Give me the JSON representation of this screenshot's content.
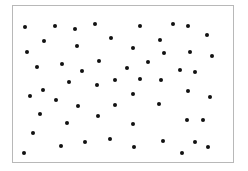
{
  "frame": {
    "left": 12,
    "top": 5,
    "width": 222,
    "height": 158,
    "border_color": "#b8b8b8"
  },
  "dot_color": "#111111",
  "dots": [
    [
      25,
      27
    ],
    [
      55,
      26
    ],
    [
      75,
      29
    ],
    [
      95,
      24
    ],
    [
      111,
      38
    ],
    [
      44,
      41
    ],
    [
      77,
      46
    ],
    [
      27,
      52
    ],
    [
      37,
      67
    ],
    [
      62,
      64
    ],
    [
      99,
      61
    ],
    [
      82,
      71
    ],
    [
      69,
      82
    ],
    [
      97,
      85
    ],
    [
      115,
      80
    ],
    [
      140,
      26
    ],
    [
      173,
      24
    ],
    [
      188,
      26
    ],
    [
      207,
      35
    ],
    [
      160,
      40
    ],
    [
      133,
      48
    ],
    [
      164,
      53
    ],
    [
      190,
      52
    ],
    [
      212,
      56
    ],
    [
      148,
      62
    ],
    [
      127,
      68
    ],
    [
      180,
      70
    ],
    [
      195,
      72
    ],
    [
      140,
      79
    ],
    [
      161,
      80
    ],
    [
      30,
      96
    ],
    [
      43,
      90
    ],
    [
      56,
      100
    ],
    [
      78,
      106
    ],
    [
      115,
      105
    ],
    [
      40,
      114
    ],
    [
      98,
      116
    ],
    [
      67,
      123
    ],
    [
      33,
      133
    ],
    [
      61,
      146
    ],
    [
      85,
      142
    ],
    [
      110,
      139
    ],
    [
      24,
      153
    ],
    [
      133,
      94
    ],
    [
      188,
      91
    ],
    [
      210,
      97
    ],
    [
      159,
      104
    ],
    [
      133,
      124
    ],
    [
      187,
      120
    ],
    [
      203,
      120
    ],
    [
      134,
      147
    ],
    [
      163,
      141
    ],
    [
      195,
      142
    ],
    [
      208,
      147
    ],
    [
      182,
      153
    ]
  ]
}
